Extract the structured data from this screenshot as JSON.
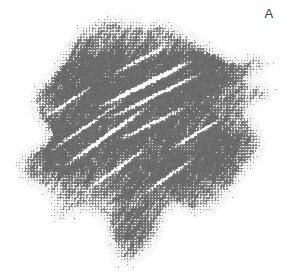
{
  "figure": {
    "panel_label": "A",
    "image_type": "halftone-micrograph",
    "background_color": "#ffffff",
    "label_color": "#3a3a3a",
    "width": 294,
    "height": 274,
    "specimen": {
      "description": "irregular fibrous specimen mass",
      "tone_min": "#ffffff",
      "tone_mid": "#9a9a9a",
      "tone_dark": "#6b6b6b",
      "tone_darkest": "#4e4e4e",
      "texture": "crosshatched halftone with diagonal fiber striations",
      "bounds": {
        "x": 18,
        "y": 18,
        "width": 264,
        "height": 250
      },
      "outline": [
        [
          96,
          22
        ],
        [
          112,
          17
        ],
        [
          128,
          20
        ],
        [
          146,
          26
        ],
        [
          160,
          22
        ],
        [
          172,
          28
        ],
        [
          188,
          36
        ],
        [
          202,
          44
        ],
        [
          214,
          52
        ],
        [
          224,
          58
        ],
        [
          236,
          62
        ],
        [
          248,
          60
        ],
        [
          258,
          56
        ],
        [
          266,
          58
        ],
        [
          270,
          64
        ],
        [
          264,
          70
        ],
        [
          252,
          74
        ],
        [
          244,
          80
        ],
        [
          254,
          84
        ],
        [
          266,
          88
        ],
        [
          272,
          94
        ],
        [
          266,
          100
        ],
        [
          254,
          104
        ],
        [
          246,
          112
        ],
        [
          250,
          122
        ],
        [
          258,
          132
        ],
        [
          262,
          144
        ],
        [
          256,
          156
        ],
        [
          246,
          166
        ],
        [
          238,
          178
        ],
        [
          232,
          190
        ],
        [
          222,
          200
        ],
        [
          210,
          208
        ],
        [
          198,
          212
        ],
        [
          186,
          210
        ],
        [
          176,
          204
        ],
        [
          168,
          208
        ],
        [
          162,
          218
        ],
        [
          158,
          230
        ],
        [
          152,
          242
        ],
        [
          144,
          252
        ],
        [
          134,
          260
        ],
        [
          124,
          264
        ],
        [
          116,
          258
        ],
        [
          112,
          246
        ],
        [
          110,
          232
        ],
        [
          106,
          220
        ],
        [
          98,
          212
        ],
        [
          88,
          208
        ],
        [
          78,
          210
        ],
        [
          70,
          216
        ],
        [
          62,
          218
        ],
        [
          56,
          212
        ],
        [
          54,
          202
        ],
        [
          50,
          192
        ],
        [
          42,
          186
        ],
        [
          32,
          182
        ],
        [
          24,
          176
        ],
        [
          20,
          168
        ],
        [
          24,
          158
        ],
        [
          34,
          150
        ],
        [
          44,
          144
        ],
        [
          50,
          136
        ],
        [
          46,
          126
        ],
        [
          38,
          116
        ],
        [
          34,
          104
        ],
        [
          38,
          92
        ],
        [
          48,
          80
        ],
        [
          58,
          68
        ],
        [
          66,
          56
        ],
        [
          72,
          44
        ],
        [
          80,
          32
        ],
        [
          88,
          25
        ]
      ],
      "dense_cores": [
        {
          "x": 150,
          "y": 62,
          "rx": 68,
          "ry": 40,
          "tone": 0.52
        },
        {
          "x": 112,
          "y": 104,
          "rx": 74,
          "ry": 52,
          "tone": 0.46
        },
        {
          "x": 182,
          "y": 118,
          "rx": 56,
          "ry": 48,
          "tone": 0.48
        },
        {
          "x": 96,
          "y": 168,
          "rx": 62,
          "ry": 44,
          "tone": 0.45
        },
        {
          "x": 178,
          "y": 178,
          "rx": 46,
          "ry": 34,
          "tone": 0.42
        },
        {
          "x": 72,
          "y": 72,
          "rx": 44,
          "ry": 34,
          "tone": 0.4
        },
        {
          "x": 214,
          "y": 70,
          "rx": 34,
          "ry": 24,
          "tone": 0.34
        },
        {
          "x": 134,
          "y": 228,
          "rx": 26,
          "ry": 30,
          "tone": 0.36
        },
        {
          "x": 226,
          "y": 150,
          "rx": 30,
          "ry": 34,
          "tone": 0.32
        },
        {
          "x": 52,
          "y": 142,
          "rx": 32,
          "ry": 30,
          "tone": 0.33
        }
      ],
      "bright_streaks": [
        {
          "x1": 96,
          "y1": 108,
          "x2": 196,
          "y2": 58,
          "w": 2.2
        },
        {
          "x1": 104,
          "y1": 120,
          "x2": 206,
          "y2": 70,
          "w": 1.6
        },
        {
          "x1": 60,
          "y1": 168,
          "x2": 150,
          "y2": 104,
          "w": 1.8
        },
        {
          "x1": 48,
          "y1": 152,
          "x2": 128,
          "y2": 96,
          "w": 1.4
        },
        {
          "x1": 118,
          "y1": 140,
          "x2": 186,
          "y2": 106,
          "w": 1.5
        },
        {
          "x1": 86,
          "y1": 190,
          "x2": 148,
          "y2": 146,
          "w": 1.3
        },
        {
          "x1": 140,
          "y1": 196,
          "x2": 198,
          "y2": 154,
          "w": 1.2
        },
        {
          "x1": 112,
          "y1": 74,
          "x2": 168,
          "y2": 44,
          "w": 1.3
        },
        {
          "x1": 168,
          "y1": 150,
          "x2": 224,
          "y2": 116,
          "w": 1.2
        },
        {
          "x1": 40,
          "y1": 120,
          "x2": 94,
          "y2": 84,
          "w": 1.1
        }
      ],
      "dark_fibers": [
        {
          "x1": 118,
          "y1": 72,
          "x2": 200,
          "y2": 50,
          "w": 1.4
        },
        {
          "x1": 70,
          "y1": 130,
          "x2": 152,
          "y2": 92,
          "w": 1.2
        },
        {
          "x1": 92,
          "y1": 162,
          "x2": 166,
          "y2": 122,
          "w": 1.1
        },
        {
          "x1": 146,
          "y1": 182,
          "x2": 210,
          "y2": 142,
          "w": 1.0
        },
        {
          "x1": 56,
          "y1": 100,
          "x2": 118,
          "y2": 66,
          "w": 1.0
        },
        {
          "x1": 160,
          "y1": 108,
          "x2": 226,
          "y2": 84,
          "w": 1.0
        },
        {
          "x1": 104,
          "y1": 206,
          "x2": 158,
          "y2": 174,
          "w": 0.9
        }
      ]
    }
  }
}
